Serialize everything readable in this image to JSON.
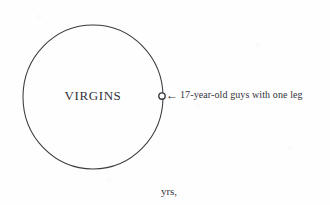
{
  "figure": {
    "kind": "venn-style-single-set-diagram",
    "background_color": "#fefefe",
    "ink_color": "#33333b",
    "set": {
      "label": "VIRGINS",
      "shape": "circle",
      "center_x": 93,
      "center_y": 97,
      "radius_x": 70,
      "radius_y": 72,
      "stroke_color": "#3a3a40",
      "stroke_width": 1,
      "fill": "none"
    },
    "point_marker": {
      "name": "17-year-old guys with one leg",
      "shape": "small-open-circle",
      "x": 162,
      "y": 96,
      "radius": 3.2,
      "stroke_color": "#35353d",
      "fill": "none"
    },
    "annotation": {
      "arrow_glyph": "←",
      "arrow_direction": "left",
      "text": "17-year-old guys with one leg"
    },
    "stray_text": "yrs,"
  }
}
